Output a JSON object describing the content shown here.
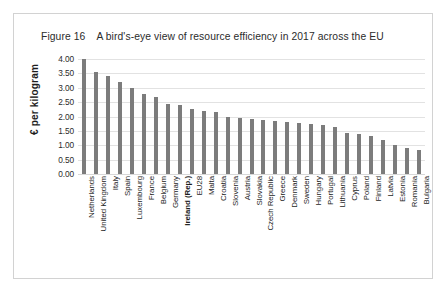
{
  "figure": {
    "number": "Figure 16",
    "title": "A bird's-eye view of resource efficiency in 2017 across the EU"
  },
  "colors": {
    "bar": "#7c7c7c",
    "gridline": "#e2e2e2",
    "frame_border": "#d2d2d2",
    "text": "#1d1d1d",
    "background": "#ffffff"
  },
  "chart_data": {
    "type": "bar",
    "title": "A bird's-eye view of resource efficiency in 2017 across the EU",
    "xlabel": "",
    "ylabel": "€ per kilogram",
    "ylim": [
      0,
      4.0
    ],
    "ytick_labels": [
      "4.00",
      "3.50",
      "3.00",
      "2.50",
      "2.00",
      "1.50",
      "1.00",
      "0.50",
      "0.00"
    ],
    "ytick_values": [
      4.0,
      3.5,
      3.0,
      2.5,
      2.0,
      1.5,
      1.0,
      0.5,
      0.0
    ],
    "grid": true,
    "legend": null,
    "highlight_category": "Ireland (Rep.)",
    "categories": [
      "Netherlands",
      "United Kingdom",
      "Italy",
      "Spain",
      "Luxembourg",
      "France",
      "Belgium",
      "Germany",
      "Ireland (Rep.)",
      "EU28",
      "Malta",
      "Croatia",
      "Slovenia",
      "Austria",
      "Slovakia",
      "Czech Republic",
      "Greece",
      "Denmark",
      "Sweden",
      "Hungary",
      "Portugal",
      "Lithuania",
      "Cyprus",
      "Poland",
      "Finland",
      "Latvia",
      "Estonia",
      "Romania",
      "Bulgaria"
    ],
    "values": [
      4.0,
      3.55,
      3.4,
      3.2,
      3.0,
      2.8,
      2.68,
      2.45,
      2.4,
      2.25,
      2.2,
      2.15,
      1.98,
      1.95,
      1.92,
      1.88,
      1.85,
      1.82,
      1.78,
      1.75,
      1.7,
      1.62,
      1.42,
      1.4,
      1.32,
      1.18,
      1.02,
      0.92,
      0.85
    ]
  }
}
